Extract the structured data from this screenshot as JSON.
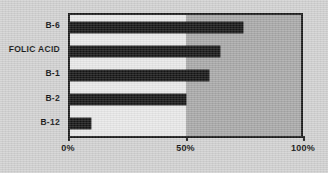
{
  "chart_data": {
    "type": "bar",
    "orientation": "horizontal",
    "title": "",
    "subtitle": "",
    "xlabel": "",
    "ylabel": "",
    "categories": [
      "B-6",
      "FOLIC ACID",
      "B-1",
      "B-2",
      "B-12"
    ],
    "values": [
      75,
      65,
      60,
      50,
      9
    ],
    "value_unit": "%",
    "xlim": [
      0,
      100
    ],
    "x_ticks": [
      0,
      50,
      100
    ],
    "x_tick_labels": [
      "0%",
      "50%",
      "100%"
    ],
    "grid": false,
    "legend": null,
    "annotations": [
      {
        "name": "shaded-region",
        "from": 50,
        "to": 100,
        "color": "#a9a9a9"
      }
    ],
    "series": [
      {
        "name": "deficiency",
        "color": "#151515",
        "values": [
          75,
          65,
          60,
          50,
          9
        ]
      }
    ]
  },
  "style": {
    "page_background": "#d2d2d2",
    "plot_background": "#e9e9e9",
    "shade_color": "#a9a9a9",
    "bar_color": "#151515",
    "frame_color": "#1a1a1a",
    "text_color": "#111111"
  }
}
